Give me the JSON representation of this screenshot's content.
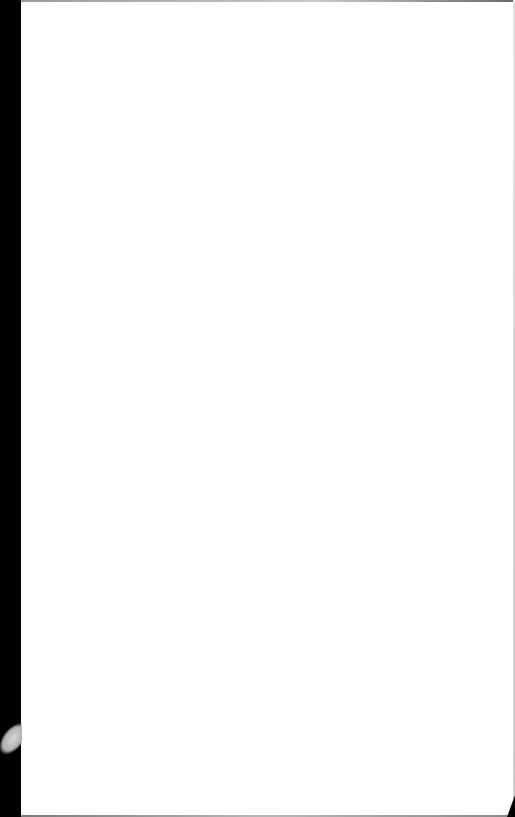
{
  "page": {
    "type": "blank scanned page",
    "text": "",
    "colors": {
      "paper": "#ffffff",
      "binding_edge": "#000000"
    }
  }
}
